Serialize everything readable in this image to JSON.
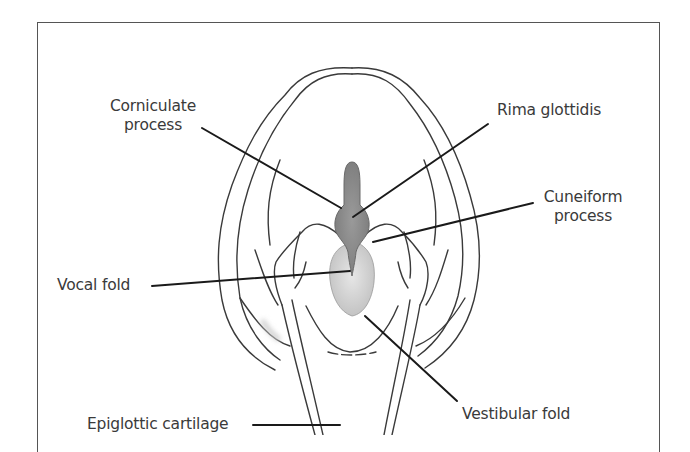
{
  "figure": {
    "labels": {
      "corniculate_process": "Corniculate\nprocess",
      "rima_glottidis": "Rima glottidis",
      "cuneiform_process": "Cuneiform\nprocess",
      "vocal_fold": "Vocal fold",
      "vestibular_fold": "Vestibular fold",
      "epiglottic_cartilage": "Epiglottic cartilage"
    },
    "colors": {
      "line": "#3a3a3a",
      "leader": "#1a1a1a",
      "rima_fill": "#8c8c8c",
      "vestibular_fill": "#cfcfcf",
      "label_text": "#3a3a3a"
    }
  }
}
